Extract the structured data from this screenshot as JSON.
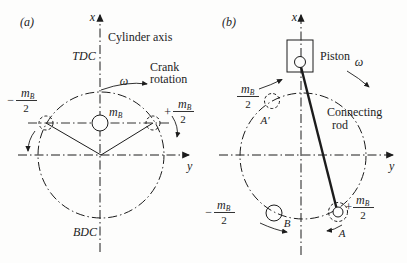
{
  "panel_a": {
    "label": "(a)",
    "x_axis_label": "x",
    "y_axis_label": "y",
    "cylinder_axis_label": "Cylinder axis",
    "tdc_label": "TDC",
    "bdc_label": "BDC",
    "crank_rotation_label_line1": "Crank",
    "crank_rotation_label_line2": "rotation",
    "omega_symbol": "ω",
    "center_mass": {
      "symbol": "m",
      "subscript": "B"
    },
    "left_half_mass": {
      "sign": "−",
      "numerator_symbol": "m",
      "numerator_subscript": "B",
      "denominator": "2"
    },
    "right_half_mass": {
      "sign": "+",
      "numerator_symbol": "m",
      "numerator_subscript": "B",
      "denominator": "2"
    }
  },
  "panel_b": {
    "label": "(b)",
    "x_axis_label": "x",
    "y_axis_label": "y",
    "piston_label": "Piston",
    "connecting_rod_label_line1": "Connecting",
    "connecting_rod_label_line2": "rod",
    "omega_symbol": "ω",
    "point_a_prime_label": "A′",
    "point_a_label": "A",
    "point_b_label": "B",
    "upper_left_half_mass": {
      "sign": "",
      "numerator_symbol": "m",
      "numerator_subscript": "B",
      "denominator": "2"
    },
    "lower_left_half_mass": {
      "sign": "−",
      "numerator_symbol": "m",
      "numerator_subscript": "B",
      "denominator": "2"
    },
    "crank_half_mass": {
      "sign": "+",
      "numerator_symbol": "m",
      "numerator_subscript": "B",
      "denominator": "2"
    }
  },
  "ink_color": "#1c1c1c"
}
